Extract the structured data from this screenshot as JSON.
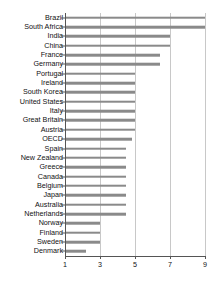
{
  "chart_data": {
    "type": "bar",
    "orientation": "horizontal",
    "title": "",
    "xlabel": "",
    "ylabel": "",
    "xlim": [
      1,
      9.4
    ],
    "xticks": [
      1,
      3,
      5,
      7,
      9
    ],
    "grid": true,
    "legend": "none",
    "bar_color": "#8a8a8a",
    "axis_color": "#555555",
    "grid_color": "#c8c8c8",
    "background": "#ffffff",
    "categories": [
      "Brazil",
      "South Africa",
      "India",
      "China",
      "France",
      "Germany",
      "Portugal",
      "Ireland",
      "South Korea",
      "United States",
      "Italy",
      "Great Britain",
      "Austria",
      "OECD",
      "Spain",
      "New Zealand",
      "Greece",
      "Canada",
      "Belgium",
      "Japan",
      "Australia",
      "Netherlands",
      "Norway",
      "Finland",
      "Sweden",
      "Denmark"
    ],
    "values": [
      9.0,
      9.0,
      7.0,
      7.0,
      6.4,
      6.4,
      5.0,
      5.0,
      5.0,
      5.0,
      5.0,
      5.0,
      5.0,
      4.8,
      4.5,
      4.5,
      4.5,
      4.5,
      4.5,
      4.5,
      4.5,
      4.5,
      3.0,
      3.0,
      3.0,
      2.2
    ]
  }
}
